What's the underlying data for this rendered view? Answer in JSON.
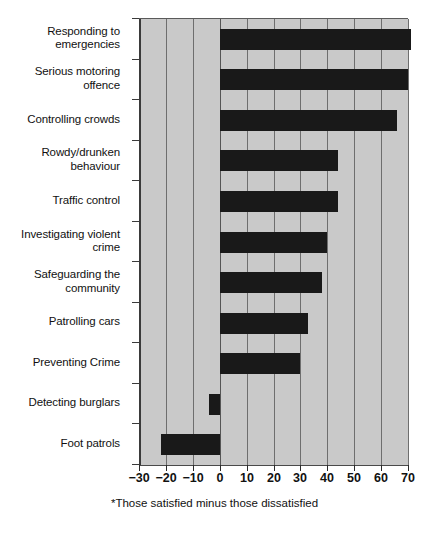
{
  "chart_data": {
    "type": "bar",
    "orientation": "horizontal",
    "title": "",
    "subtitle": "",
    "xlabel": "",
    "ylabel": "",
    "footnote": "*Those satisfied minus those dissatisfied",
    "xlim": [
      -30,
      70
    ],
    "xticks": [
      -30,
      -20,
      -10,
      0,
      10,
      20,
      30,
      40,
      50,
      60,
      70
    ],
    "xtick_labels": [
      "−30",
      "−20",
      "−10",
      "0",
      "10",
      "20",
      "30",
      "40",
      "50",
      "60",
      "70"
    ],
    "grid": "vertical",
    "legend": "none",
    "bar_color": "#191919",
    "plot_background": "#c9c9c9",
    "categories": [
      "Responding to emergencies",
      "Serious motoring offence",
      "Controlling crowds",
      "Rowdy/drunken behaviour",
      "Traffic control",
      "Investigating violent crime",
      "Safeguarding the community",
      "Patrolling cars",
      "Preventing Crime",
      "Detecting burglars",
      "Foot patrols"
    ],
    "values": [
      71,
      70,
      66,
      44,
      44,
      40,
      38,
      33,
      30,
      -4,
      -22
    ]
  },
  "labels": {
    "category_lines": [
      [
        "Responding to",
        "emergencies"
      ],
      [
        "Serious motoring",
        "offence"
      ],
      [
        "Controlling crowds"
      ],
      [
        "Rowdy/drunken",
        "behaviour"
      ],
      [
        "Traffic control"
      ],
      [
        "Investigating violent",
        "crime"
      ],
      [
        "Safeguarding the",
        "community"
      ],
      [
        "Patrolling cars"
      ],
      [
        "Preventing Crime"
      ],
      [
        "Detecting burglars"
      ],
      [
        "Foot patrols"
      ]
    ]
  }
}
